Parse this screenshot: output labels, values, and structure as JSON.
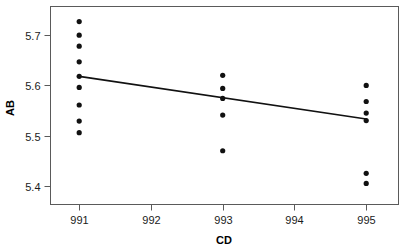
{
  "chart_data": {
    "type": "scatter",
    "title": "",
    "xlabel": "CD",
    "ylabel": "AB",
    "xlim": [
      990.6,
      995.45
    ],
    "ylim": [
      5.363,
      5.757
    ],
    "grid": false,
    "legend": null,
    "xticks": [
      991,
      992,
      993,
      994,
      995
    ],
    "xtick_labels": [
      "991",
      "992",
      "993",
      "994",
      "995"
    ],
    "yticks": [
      5.4,
      5.5,
      5.6,
      5.7
    ],
    "ytick_labels": [
      "5.4",
      "5.5",
      "5.6",
      "5.7"
    ],
    "points": [
      {
        "x": 991,
        "y": 5.727
      },
      {
        "x": 991,
        "y": 5.7
      },
      {
        "x": 991,
        "y": 5.678
      },
      {
        "x": 991,
        "y": 5.647
      },
      {
        "x": 991,
        "y": 5.618
      },
      {
        "x": 991,
        "y": 5.596
      },
      {
        "x": 991,
        "y": 5.561
      },
      {
        "x": 991,
        "y": 5.529
      },
      {
        "x": 991,
        "y": 5.506
      },
      {
        "x": 993,
        "y": 5.62
      },
      {
        "x": 993,
        "y": 5.594
      },
      {
        "x": 993,
        "y": 5.574
      },
      {
        "x": 993,
        "y": 5.541
      },
      {
        "x": 993,
        "y": 5.47
      },
      {
        "x": 995,
        "y": 5.6
      },
      {
        "x": 995,
        "y": 5.568
      },
      {
        "x": 995,
        "y": 5.545
      },
      {
        "x": 995,
        "y": 5.53
      },
      {
        "x": 995,
        "y": 5.425
      },
      {
        "x": 995,
        "y": 5.405
      }
    ],
    "fit_line": {
      "name": "linear fit",
      "x_start": 991,
      "y_start": 5.618,
      "x_end": 995,
      "y_end": 5.533
    },
    "marker": {
      "shape": "circle",
      "size_px": 2.6,
      "color": "#111111"
    },
    "colors": {
      "point": "#111111",
      "line": "#111111",
      "axis": "#5a5a5a",
      "text": "#1a1a1a",
      "background": "#ffffff"
    }
  }
}
